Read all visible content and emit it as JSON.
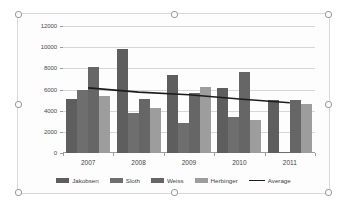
{
  "chart_object": {
    "selected": true,
    "handles": [
      "top-left",
      "top-center",
      "top-right",
      "middle-left",
      "middle-right",
      "bottom-left",
      "bottom-center",
      "bottom-right"
    ]
  },
  "chart_data": {
    "type": "bar",
    "title": "",
    "subtitle": "",
    "xlabel": "",
    "ylabel": "",
    "categories": [
      "2007",
      "2008",
      "2009",
      "2010",
      "2011"
    ],
    "series": [
      {
        "name": "Jakobsen",
        "color": "#5e5e5e",
        "values": [
          5150,
          9800,
          7350,
          6100,
          5050
        ]
      },
      {
        "name": "Sloth",
        "color": "#6e6e6e",
        "values": [
          5950,
          3750,
          2800,
          3450,
          100
        ]
      },
      {
        "name": "Weiss",
        "color": "#666666",
        "values": [
          8150,
          5100,
          5650,
          7650,
          5050
        ]
      },
      {
        "name": "Herbinger",
        "color": "#9d9d9d",
        "values": [
          5350,
          4300,
          6250,
          3150,
          4600
        ]
      }
    ],
    "trend": {
      "name": "Average",
      "type": "line",
      "color": "#1c1c1c",
      "values": [
        6150,
        5750,
        5500,
        5100,
        4750
      ]
    },
    "yticks": [
      0,
      2000,
      4000,
      6000,
      8000,
      10000,
      12000
    ],
    "ylim": [
      0,
      12000
    ],
    "grid": true,
    "legend_position": "bottom",
    "legend": [
      "Jakobsen",
      "Sloth",
      "Weiss",
      "Herbinger",
      "Average"
    ]
  }
}
